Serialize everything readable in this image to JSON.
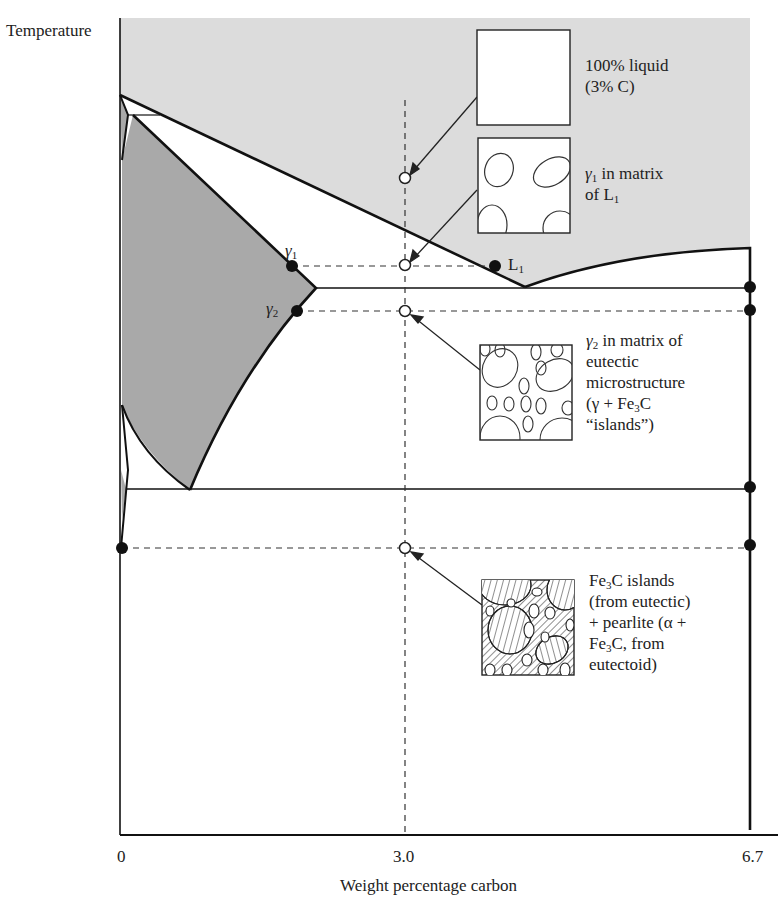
{
  "figure": {
    "y_axis_label": "Temperature",
    "x_axis_label": "Weight percentage carbon",
    "x_ticks": [
      "0",
      "3.0",
      "6.7"
    ]
  },
  "points": {
    "gamma1": {
      "symbol": "γ",
      "sub": "1"
    },
    "gamma2": {
      "symbol": "γ",
      "sub": "2"
    },
    "liquid1": {
      "symbol": "L",
      "sub": "1"
    }
  },
  "callouts": [
    {
      "lines": [
        "100% liquid",
        "(3% C)"
      ],
      "microstructure": "empty-liquid"
    },
    {
      "line1_pre": "γ",
      "line1_sub": "1",
      "line1_post": " in matrix",
      "line2_pre": "of L",
      "line2_sub": "1",
      "microstructure": "gamma-grains"
    },
    {
      "line1_pre": "γ",
      "line1_sub": "2",
      "line1_post": " in matrix of",
      "line2": "eutectic",
      "line3": "microstructure",
      "line4_pre": "(γ + Fe",
      "line4_sub": "3",
      "line4_post": "C",
      "line5": "“islands”)",
      "microstructure": "eutectic"
    },
    {
      "line1_pre": "Fe",
      "line1_sub": "3",
      "line1_post": "C islands",
      "line2": "(from eutectic)",
      "line3": "+ pearlite (α +",
      "line4_pre": "Fe",
      "line4_sub": "3",
      "line4_post": "C, from",
      "line5": "eutectoid)",
      "microstructure": "pearlite"
    }
  ],
  "colors": {
    "liquid_region": "#dcdcdc",
    "austenite_region": "#a9a9a9",
    "lines": "#111111",
    "background": "#ffffff"
  }
}
